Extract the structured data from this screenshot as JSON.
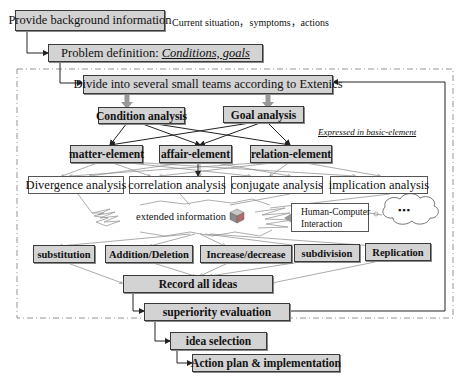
{
  "top": {
    "background_box": "Provide background information",
    "background_note": "Current situation，symptoms，actions",
    "problem_prefix": "Problem definition: ",
    "problem_emphasis": "Conditions, goals"
  },
  "loop": {
    "divide": "Divide into several small teams according to Extenics",
    "condition": "Condition analysis",
    "goal": "Goal analysis",
    "expressed_note": "Expressed in basic-element",
    "elements": [
      "matter-element",
      "affair-element",
      "relation-element"
    ],
    "analyses": [
      "Divergence analysis",
      "correlation analysis",
      "conjugate analysis",
      "implication analysis"
    ],
    "extended": "extended information",
    "hci_line1": "Human-Computer",
    "hci_line2": "Interaction",
    "cloud": "▪▪▪",
    "transforms": [
      "substitution",
      "Addition/Deletion",
      "Increase/decrease",
      "subdivision",
      "Replication"
    ],
    "record": "Record all ideas",
    "superiority": "superiority evaluation"
  },
  "bottom": {
    "idea_selection": "idea selection",
    "action_plan": "Action plan & implementation"
  },
  "colors": {
    "box_fill": "#d3d3d3",
    "line": "#222222",
    "thin_line": "#777777"
  }
}
